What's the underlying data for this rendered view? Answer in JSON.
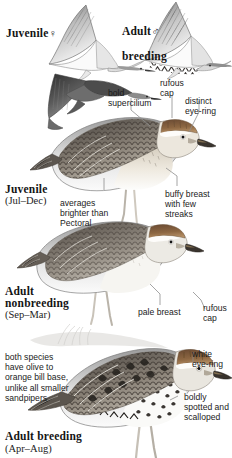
{
  "plate": {
    "title": "Sharp-tailed Sandpiper plumages",
    "background_color": "#ffffff",
    "ink_color": "#1a1a1a"
  },
  "headers": [
    {
      "id": "juvenile-female-flight",
      "label": "Juvenile",
      "symbol": "♀",
      "symbol_name": "female-symbol"
    },
    {
      "id": "adult-male-breeding-flight",
      "label": "Adult",
      "symbol": "♂",
      "symbol_name": "male-symbol",
      "second_line": "breeding"
    }
  ],
  "captions": [
    {
      "id": "juvenile",
      "name": "Juvenile",
      "dates": "(Jul–Dec)"
    },
    {
      "id": "adult-nonbreeding",
      "name_line1": "Adult",
      "name_line2": "nonbreeding",
      "dates": "(Sep–Mar)"
    },
    {
      "id": "adult-breeding",
      "name": "Adult breeding",
      "dates": "(Apr–Aug)"
    }
  ],
  "annotations": [
    {
      "id": "bold-supercilium",
      "text": "bold\nsupercilium"
    },
    {
      "id": "rufous-cap-top",
      "text": "rufous\ncap"
    },
    {
      "id": "distinct-eye-ring",
      "text": "distinct\neye-ring"
    },
    {
      "id": "averages-brighter",
      "text": "averages\nbrighter than\nPectoral"
    },
    {
      "id": "buffy-breast",
      "text": "buffy breast\nwith few\nstreaks"
    },
    {
      "id": "pale-breast",
      "text": "pale breast"
    },
    {
      "id": "rufous-cap-lower",
      "text": "rufous\ncap"
    },
    {
      "id": "white-eye-ring",
      "text": "white\neye-ring"
    },
    {
      "id": "boldly-spotted",
      "text": "boldly\nspotted and\nscalloped"
    }
  ],
  "notes": [
    {
      "id": "bill-base-note",
      "text": "both species\nhave olive to\norange bill base,\nunlike all smaller\nsandpipers"
    }
  ],
  "figures": [
    {
      "id": "flight-juvenile-underside",
      "name": "juvenile-flight-underside"
    },
    {
      "id": "flight-adult-breeding-underside",
      "name": "adult-breeding-flight-underside"
    },
    {
      "id": "flight-dark-upperside",
      "name": "juvenile-flight-upperside"
    },
    {
      "id": "standing-juvenile",
      "name": "juvenile-standing"
    },
    {
      "id": "standing-adult-nonbreeding",
      "name": "adult-nonbreeding-standing"
    },
    {
      "id": "standing-adult-breeding",
      "name": "adult-breeding-standing"
    }
  ]
}
